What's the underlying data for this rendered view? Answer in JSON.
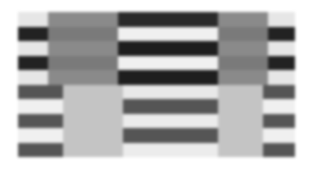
{
  "figure": {
    "rows": 10,
    "colors": {
      "dark": "#1e1e1e",
      "mid_dark": "#555555",
      "gray": "#8a8a8a",
      "light_gray": "#c4c4c4",
      "light": "#f2f2f2"
    },
    "top_rows": [
      [
        "#e6e6e6",
        "#8a8a8a",
        "#2a2a2a",
        "#8a8a8a",
        "#e6e6e6"
      ],
      [
        "#222222",
        "#7a7a7a",
        "#f0f0f0",
        "#7a7a7a",
        "#222222"
      ],
      [
        "#e6e6e6",
        "#8a8a8a",
        "#1e1e1e",
        "#8a8a8a",
        "#e6e6e6"
      ],
      [
        "#222222",
        "#7a7a7a",
        "#f0f0f0",
        "#7a7a7a",
        "#222222"
      ],
      [
        "#e6e6e6",
        "#8a8a8a",
        "#1e1e1e",
        "#8a8a8a",
        "#e6e6e6"
      ]
    ],
    "bottom_rows": [
      [
        "#555555",
        "#c4c4c4",
        "#e8e8e8",
        "#c4c4c4",
        "#555555"
      ],
      [
        "#f0f0f0",
        "#c4c4c4",
        "#555555",
        "#c4c4c4",
        "#f0f0f0"
      ],
      [
        "#555555",
        "#c4c4c4",
        "#ececec",
        "#c4c4c4",
        "#555555"
      ],
      [
        "#f0f0f0",
        "#c4c4c4",
        "#555555",
        "#c4c4c4",
        "#f0f0f0"
      ],
      [
        "#555555",
        "#c4c4c4",
        "#ececec",
        "#c4c4c4",
        "#555555"
      ]
    ],
    "segments_top": [
      [
        0,
        30
      ],
      [
        30,
        100
      ],
      [
        100,
        200
      ],
      [
        200,
        250
      ],
      [
        250,
        277
      ]
    ],
    "segments_bottom": [
      [
        0,
        45
      ],
      [
        45,
        105
      ],
      [
        105,
        200
      ],
      [
        200,
        245
      ],
      [
        245,
        277
      ]
    ]
  }
}
